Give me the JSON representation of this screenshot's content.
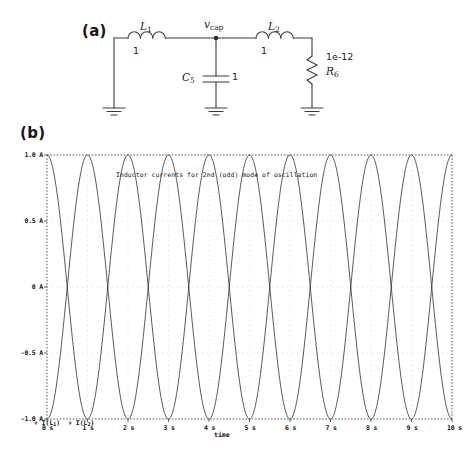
{
  "figure": {
    "panel_a_label": "(a)",
    "panel_b_label": "(b)"
  },
  "circuit": {
    "title_ref": "(a)",
    "node_label": "v",
    "node_label_sub": "cap",
    "components": [
      {
        "name": "L1",
        "symbol": "L",
        "subscript": "1",
        "value": "1",
        "type": "inductor"
      },
      {
        "name": "L2",
        "symbol": "L",
        "subscript": "2",
        "value": "1",
        "type": "inductor"
      },
      {
        "name": "C5",
        "symbol": "C",
        "subscript": "5",
        "value": "1",
        "type": "capacitor"
      },
      {
        "name": "R6",
        "symbol": "R",
        "subscript": "6",
        "value": "1e-12",
        "type": "resistor"
      }
    ],
    "ground_count": 3
  },
  "chart_data": {
    "type": "line",
    "title": "",
    "annotation": "Inductor currents for 2nd (odd) mode of oscillation",
    "xlabel": "time",
    "ylabel": "",
    "xlim": [
      0,
      10
    ],
    "ylim": [
      -1.0,
      1.0
    ],
    "grid": true,
    "legend_position": "below-left",
    "xticks": [
      0,
      1,
      2,
      3,
      4,
      5,
      6,
      7,
      8,
      9,
      10
    ],
    "xticklabels": [
      "0 s",
      "1 s",
      "2 s",
      "3 s",
      "4 s",
      "5 s",
      "6 s",
      "7 s",
      "8 s",
      "9 s",
      "10 s"
    ],
    "yticks": [
      -1.0,
      -0.5,
      0,
      0.5,
      1.0
    ],
    "yticklabels": [
      "-1.0 A",
      "-0.5 A",
      "0 A",
      "0.5 A",
      "1.0 A"
    ],
    "series": [
      {
        "name": "I(L1)",
        "legend_label": "I(L",
        "legend_sub": "1",
        "legend_close": ")",
        "marker": "+",
        "color": "#3a3a3a",
        "amplitude": 1.0,
        "period": 2.0,
        "phase_deg": 0,
        "formula": "1.0 * cos(2*pi*t/2.0)"
      },
      {
        "name": "I(L2)",
        "legend_label": "I(L",
        "legend_sub": "2",
        "legend_close": ")",
        "marker": "+",
        "color": "#3a3a3a",
        "amplitude": 1.0,
        "period": 2.0,
        "phase_deg": 180,
        "formula": "-1.0 * cos(2*pi*t/2.0)"
      }
    ]
  }
}
